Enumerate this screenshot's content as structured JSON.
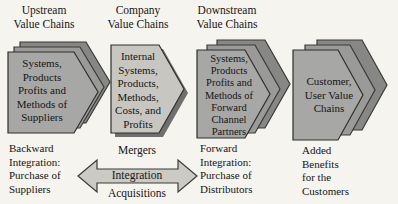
{
  "colors": {
    "background": "#f5f4ef",
    "shape_front": "#a7a7a5",
    "shape_mid": "#9a9a98",
    "shape_back": "#878785",
    "company_fill": "#c7c6c1",
    "company_shadow": "#6f6f6d",
    "arrow_fill": "#cbcac5",
    "outline": "#3a3a38",
    "text": "#151515"
  },
  "columns": {
    "upstream": {
      "header": [
        "Upstream",
        "Value Chains"
      ],
      "shape": [
        "Systems,",
        "Products",
        "Profits and",
        "Methods of",
        "Suppliers"
      ],
      "caption": [
        "Backward",
        "Integration:",
        "Purchase of",
        "Suppliers"
      ]
    },
    "company": {
      "header": [
        "Company",
        "Value Chains"
      ],
      "shape": [
        "Internal",
        "Systems,",
        "Products,",
        "Methods,",
        "Costs, and",
        "Profits"
      ]
    },
    "downstream": {
      "header": [
        "Downstream",
        "Value Chains"
      ],
      "shape": [
        "Systems,",
        "Products",
        "Profits and",
        "Methods of",
        "Forward",
        "Channel",
        "Partners"
      ],
      "caption": [
        "Forward",
        "Integration:",
        "Purchase of",
        "Distributors"
      ]
    },
    "customer": {
      "shape": [
        "Customer,",
        "User Value",
        "Chains"
      ],
      "caption": [
        "Added",
        "Benefits",
        "for the",
        "Customers"
      ]
    }
  },
  "arrow": {
    "above": "Mergers",
    "inside": "Integration",
    "below": "Acquisitions"
  }
}
